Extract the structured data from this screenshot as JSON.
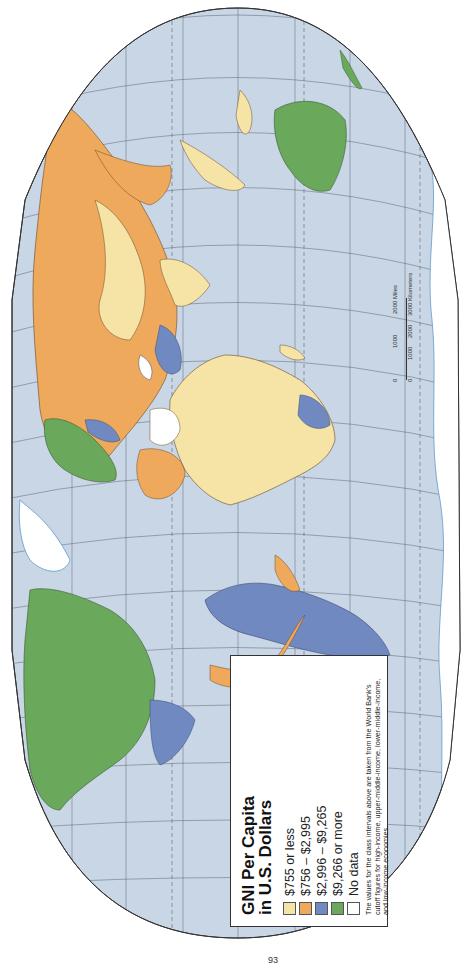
{
  "map": {
    "projection": "Robinson-like world map (rotated 90° on page)",
    "ocean_color": "#c9d6e6",
    "graticule_color": "#4a5560"
  },
  "legend": {
    "title_line1": "GNI Per Capita",
    "title_line2": "in U.S. Dollars",
    "classes": [
      {
        "label": "$755 or less",
        "color": "#f6e4a6"
      },
      {
        "label": "$756 – $2,995",
        "color": "#eea95c"
      },
      {
        "label": "$2,996 – $9,265",
        "color": "#7089c0"
      },
      {
        "label": "$9,266 or more",
        "color": "#6aa85c"
      },
      {
        "label": "No data",
        "color": "#ffffff"
      }
    ],
    "note": "The values for the class intervals above are taken from the World Bank's cutoff figures for high-income, upper-middle-income, lower-middle-income, and low-income economies."
  },
  "scale": {
    "miles_ticks": [
      "0",
      "1000",
      "2000 Miles"
    ],
    "km_ticks": [
      "0",
      "1000",
      "2000",
      "3000 Kilometers"
    ]
  },
  "page": {
    "number_fragment": "93"
  }
}
